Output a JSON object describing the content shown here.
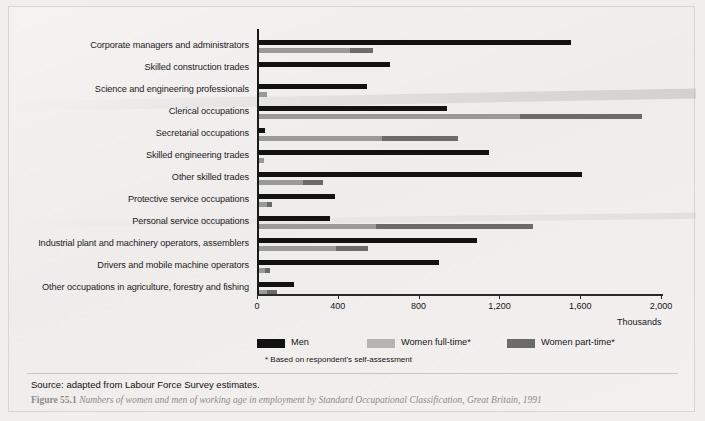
{
  "figure": {
    "source_note": "Source: adapted from Labour Force Survey estimates.",
    "figure_number": "Figure 55.1",
    "caption": "Numbers of women and men of working age in employment by Standard Occupational Classification, Great Britain, 1991",
    "footnote": "* Based on respondent's self-assessment"
  },
  "legend": {
    "position": "below-axis",
    "items": [
      {
        "label": "Men",
        "color": "#121212",
        "name": "legend-men"
      },
      {
        "label": "Women full-time*",
        "color": "#9a9a97",
        "name": "legend-women-full-time"
      },
      {
        "label": "Women part-time*",
        "color": "#6b6b69",
        "name": "legend-women-part-time"
      }
    ]
  },
  "chart_data": {
    "type": "bar",
    "orientation": "horizontal",
    "title": "Numbers of women and men of working age in employment by Standard Occupational Classification, Great Britain, 1991",
    "xlabel": "Thousands",
    "ylabel": "",
    "xlim": [
      0,
      2000
    ],
    "xticks": [
      0,
      400,
      800,
      1200,
      1600,
      2000
    ],
    "xticklabels": [
      "0",
      "400",
      "800",
      "1,200",
      "1,600",
      "2,000"
    ],
    "grid": false,
    "units": "Thousands",
    "categories": [
      "Corporate managers and administrators",
      "Skilled construction trades",
      "Science and engineering professionals",
      "Clerical occupations",
      "Secretarial occupations",
      "Skilled engineering trades",
      "Other skilled trades",
      "Protective service occupations",
      "Personal service occupations",
      "Industrial plant and machinery operators, assemblers",
      "Drivers and mobile machine operators",
      "Other occupations in agriculture, forestry and fishing"
    ],
    "series": [
      {
        "name": "Men",
        "color": "#121212",
        "values": [
          1545,
          650,
          535,
          930,
          30,
          1140,
          1600,
          375,
          350,
          1080,
          890,
          175
        ]
      },
      {
        "name": "Women full-time*",
        "color": "#9a9a97",
        "values": [
          450,
          0,
          40,
          1290,
          610,
          25,
          220,
          40,
          580,
          380,
          30,
          40
        ]
      },
      {
        "name": "Women part-time*",
        "color": "#6b6b69",
        "values": [
          115,
          0,
          0,
          605,
          375,
          0,
          95,
          25,
          775,
          160,
          25,
          50
        ]
      }
    ],
    "series_note": "Women bars are stacked: full-time segment then part-time segment; totals shown are full-time + part-time"
  }
}
